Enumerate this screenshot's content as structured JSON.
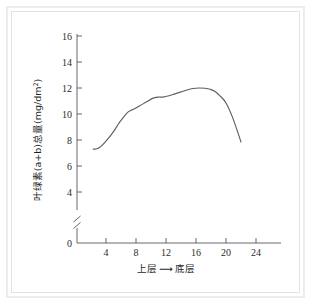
{
  "figure": {
    "background_color": "#ffffff",
    "frame_color": "#ececed",
    "line_color": "#5b5f63",
    "axis_color": "#54585c"
  },
  "chart_data": {
    "type": "line",
    "title": "",
    "subtitle": "",
    "xlabel": "上层 ⟶ 底层",
    "xlabel_parts": {
      "left": "上层",
      "arrow": "⟶",
      "right": "底层"
    },
    "ylabel": "叶绿素(a+b)总量(mg/dm²)",
    "ylabel_parts": {
      "prefix": "叶绿素(a+b)总量(mg/dm",
      "superscript": "2",
      "suffix": ")"
    },
    "xlim": [
      0,
      27
    ],
    "ylim": [
      0,
      16
    ],
    "y_axis_break": true,
    "y_break_between": [
      0,
      4
    ],
    "grid": false,
    "legend": false,
    "legend_position": "none",
    "xticks": [
      4,
      8,
      12,
      16,
      20,
      24
    ],
    "xtick_labels": [
      "4",
      "8",
      "12",
      "16",
      "20",
      "24"
    ],
    "yticks": [
      0,
      4,
      6,
      8,
      10,
      12,
      14,
      16
    ],
    "ytick_labels": [
      "0",
      "4",
      "6",
      "8",
      "10",
      "12",
      "14",
      "16"
    ],
    "series": [
      {
        "name": "叶绿素(a+b)总量",
        "x": [
          2.3,
          2.8,
          3.4,
          4.2,
          5.0,
          5.8,
          6.4,
          7.0,
          7.6,
          8.4,
          9.3,
          10.2,
          11.0,
          11.6,
          12.4,
          13.2,
          14.0,
          14.8,
          15.6,
          16.4,
          17.2,
          17.9,
          18.5,
          19.2,
          20.0,
          20.9,
          22.0
        ],
        "y": [
          7.3,
          7.32,
          7.55,
          8.05,
          8.65,
          9.35,
          9.8,
          10.18,
          10.35,
          10.6,
          10.9,
          11.2,
          11.3,
          11.3,
          11.4,
          11.55,
          11.7,
          11.85,
          11.96,
          12.0,
          11.98,
          11.9,
          11.75,
          11.4,
          10.85,
          9.7,
          7.85
        ]
      }
    ],
    "annotations": []
  }
}
